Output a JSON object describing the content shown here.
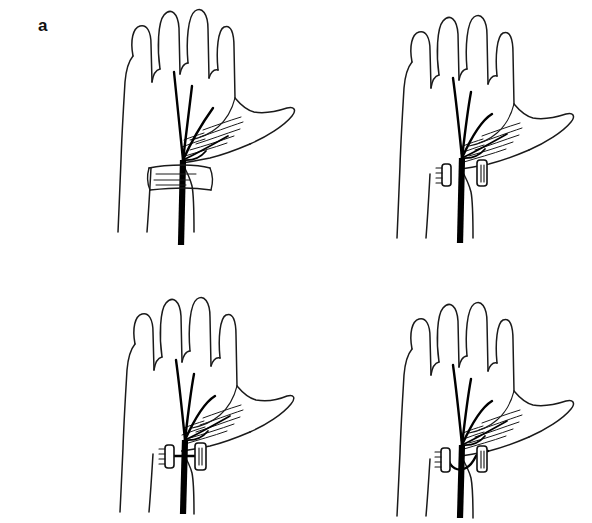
{
  "figure": {
    "background_color": "#ffffff",
    "line_color": "#1a1a1a",
    "nerve_color": "#000000",
    "width": 592,
    "height": 523,
    "type": "line-drawing",
    "layout": "2x2 grid of four labelled panels"
  },
  "panels": [
    {
      "id": "a",
      "label": "a",
      "label_position": {
        "x": 38,
        "y": 17
      },
      "state": "transverse carpal ligament intact, band crossing over median nerve",
      "has_stumps": false,
      "has_bridge": false,
      "has_loop": false
    },
    {
      "id": "b",
      "label": "b",
      "label_position": {
        "x": 358,
        "y": 17
      },
      "state": "transverse carpal ligament divided, two free stumps retracted on either side of the nerve",
      "has_stumps": true,
      "has_bridge": false,
      "has_loop": false
    },
    {
      "id": "c",
      "label": "c",
      "label_position": {
        "x": 38,
        "y": 305
      },
      "state": "ligament stumps reconnected by a straight bridge passing across the nerve",
      "has_stumps": true,
      "has_bridge": true,
      "has_loop": false
    },
    {
      "id": "d",
      "label": "d",
      "label_position": {
        "x": 358,
        "y": 305
      },
      "state": "ligament stumps reconnected by a curved loop slung around the median nerve",
      "has_stumps": true,
      "has_bridge": false,
      "has_loop": true
    }
  ],
  "anatomy": {
    "structures": [
      "hand outline",
      "four fingers",
      "thumb",
      "thenar eminence with hatching",
      "median nerve trunk",
      "common digital nerve branches",
      "recurrent motor branch",
      "transverse carpal ligament",
      "wrist"
    ],
    "nerve_branch_count": 4
  }
}
